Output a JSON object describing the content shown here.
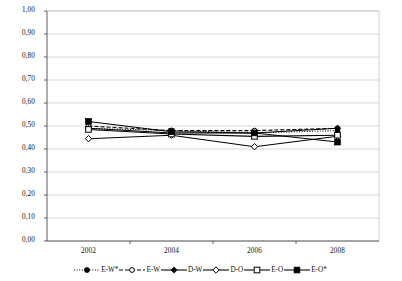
{
  "chart_data": {
    "type": "line",
    "title": "",
    "subtitle": "",
    "xlabel": "",
    "ylabel": "",
    "categories": [
      "2002",
      "2004",
      "2006",
      "2008"
    ],
    "x": [
      2002,
      2004,
      2006,
      2008
    ],
    "ylim": [
      0.0,
      1.0
    ],
    "ytick_step": 0.1,
    "ytick_labels": [
      "1,00",
      "0,90",
      "0,80",
      "0,70",
      "0,60",
      "0,50",
      "0,40",
      "0,30",
      "0,20",
      "0,10",
      "0,00"
    ],
    "ytick_values": [
      1.0,
      0.9,
      0.8,
      0.7,
      0.6,
      0.5,
      0.4,
      0.3,
      0.2,
      0.1,
      0.0
    ],
    "xtick_labels": [
      "2002",
      "2004",
      "2006",
      "2008"
    ],
    "grid": "horizontal",
    "legend_position": "bottom",
    "decimal_separator": ",",
    "series": [
      {
        "name": "E-W*",
        "values": [
          0.49,
          0.48,
          0.47,
          0.48
        ],
        "line_style": "dotted",
        "marker": "filled-circle",
        "color": "#000000"
      },
      {
        "name": "E-W",
        "values": [
          0.5,
          0.48,
          0.48,
          0.49
        ],
        "line_style": "dashed",
        "marker": "open-circle",
        "color": "#000000"
      },
      {
        "name": "D-W",
        "values": [
          0.49,
          0.47,
          0.47,
          0.49
        ],
        "line_style": "solid",
        "marker": "filled-diamond",
        "color": "#000000"
      },
      {
        "name": "D-O",
        "values": [
          0.445,
          0.46,
          0.41,
          0.455
        ],
        "line_style": "solid",
        "marker": "open-diamond",
        "color": "#000000"
      },
      {
        "name": "E-O",
        "values": [
          0.485,
          0.465,
          0.455,
          0.46
        ],
        "line_style": "solid",
        "marker": "open-square",
        "color": "#000000"
      },
      {
        "name": "E-O*",
        "values": [
          0.52,
          0.475,
          0.47,
          0.43
        ],
        "line_style": "solid",
        "marker": "filled-square",
        "color": "#000000"
      }
    ]
  },
  "axes": {
    "plot_left_px": 47,
    "plot_right_px": 379,
    "plot_top_px": 11,
    "plot_bottom_px": 241
  },
  "colors": {
    "axis": "#4d4d4d",
    "grid": "#c8c8c8",
    "series": "#000000",
    "text": "#111111",
    "background": "#ffffff"
  }
}
